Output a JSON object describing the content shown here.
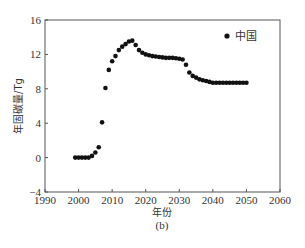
{
  "chart_data": {
    "type": "scatter",
    "title": "",
    "subtitle": "(b)",
    "xlabel": "年份",
    "ylabel": "年固碳量/Tg",
    "xlim": [
      1990,
      2060
    ],
    "ylim": [
      -4,
      16
    ],
    "xticks": [
      1990,
      2000,
      2010,
      2020,
      2030,
      2040,
      2050,
      2060
    ],
    "yticks": [
      -4,
      0,
      4,
      8,
      12,
      16
    ],
    "grid": false,
    "legend_position": "upper right",
    "series": [
      {
        "name": "中国",
        "marker": "circle",
        "color": "#111111",
        "x": [
          1999,
          2000,
          2001,
          2002,
          2003,
          2004,
          2005,
          2006,
          2007,
          2008,
          2009,
          2010,
          2011,
          2012,
          2013,
          2014,
          2015,
          2016,
          2017,
          2018,
          2019,
          2020,
          2021,
          2022,
          2023,
          2024,
          2025,
          2026,
          2027,
          2028,
          2029,
          2030,
          2031,
          2032,
          2033,
          2034,
          2035,
          2036,
          2037,
          2038,
          2039,
          2040,
          2041,
          2042,
          2043,
          2044,
          2045,
          2046,
          2047,
          2048,
          2049,
          2050
        ],
        "values": [
          0.0,
          0.0,
          0.0,
          0.0,
          0.0,
          0.2,
          0.6,
          1.2,
          4.1,
          8.1,
          10.2,
          11.2,
          11.8,
          12.5,
          12.9,
          13.2,
          13.5,
          13.6,
          13.1,
          12.5,
          12.2,
          12.0,
          11.9,
          11.8,
          11.75,
          11.7,
          11.65,
          11.6,
          11.6,
          11.6,
          11.55,
          11.5,
          11.4,
          10.8,
          9.9,
          9.5,
          9.3,
          9.1,
          9.0,
          8.9,
          8.8,
          8.7,
          8.7,
          8.7,
          8.7,
          8.7,
          8.7,
          8.7,
          8.7,
          8.7,
          8.7,
          8.7
        ]
      }
    ]
  }
}
